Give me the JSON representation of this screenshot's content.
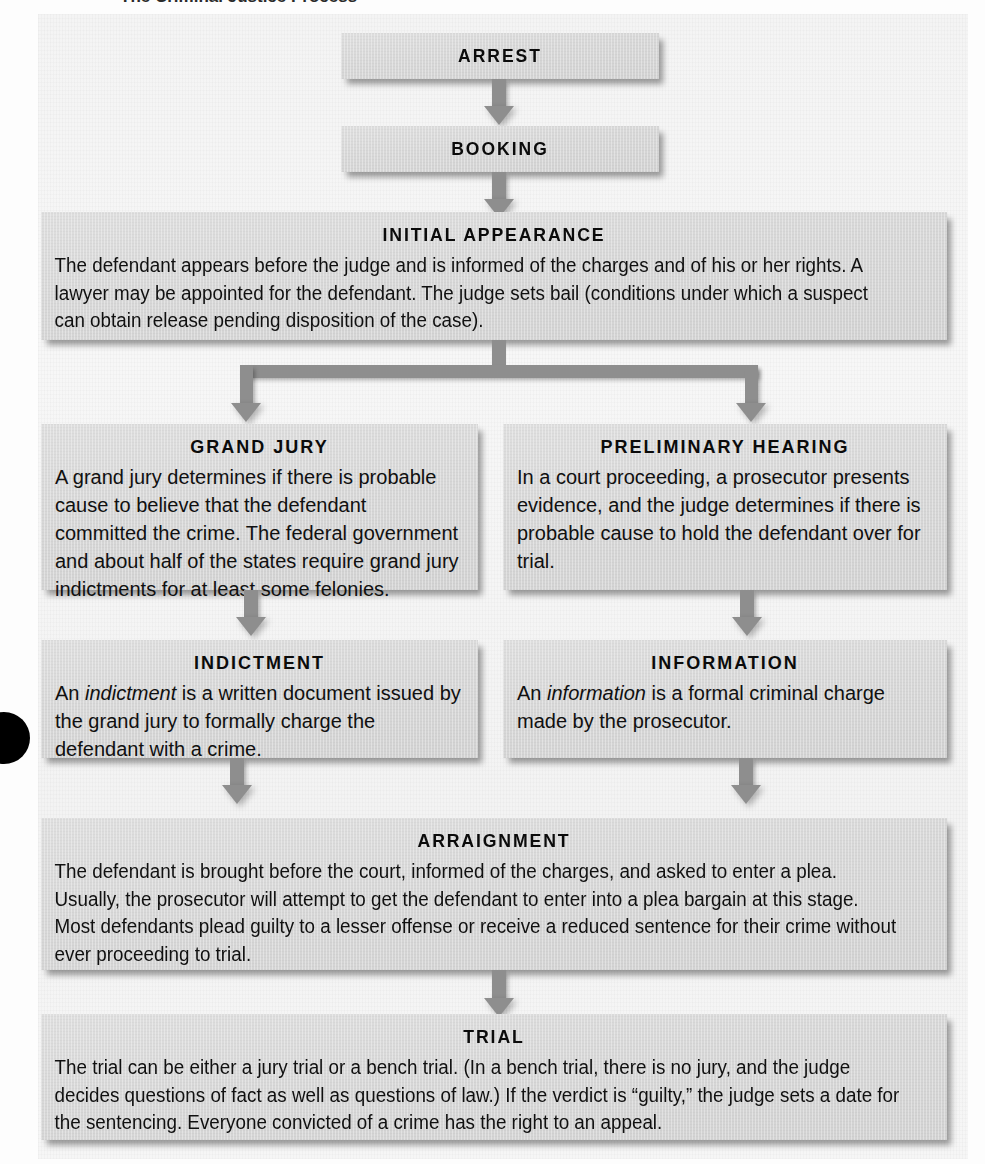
{
  "figure": {
    "kind": "flowchart",
    "clipped_header_sliver": "The Criminal Justice Process",
    "box_fill_color": "#d7d7d7",
    "connector_color": "#8e8e8e",
    "text_color": "#101010",
    "page_background": "#f5f5f5"
  },
  "nodes": {
    "arrest": {
      "title": "ARREST",
      "body": ""
    },
    "booking": {
      "title": "BOOKING",
      "body": ""
    },
    "initial_appearance": {
      "title": "INITIAL APPEARANCE",
      "body": "The defendant appears before the judge and is informed of the charges and of his or her rights. A lawyer may be appointed for the defendant. The judge sets bail (conditions under which a suspect can obtain release pending disposition of the case)."
    },
    "grand_jury": {
      "title": "GRAND JURY",
      "body": "A grand jury determines if there is probable cause to believe that the defendant committed the crime. The federal government and about half of the states require grand jury indictments for at least some felonies."
    },
    "preliminary_hearing": {
      "title": "PRELIMINARY HEARING",
      "body": "In a court proceeding, a prosecutor presents evidence, and the judge determines if there is probable cause to hold the defendant over for trial."
    },
    "indictment": {
      "title": "INDICTMENT",
      "body_part1": "An ",
      "body_italic": "indictment",
      "body_part2": " is a written document issued by the grand jury to formally charge the defendant with a crime."
    },
    "information": {
      "title": "INFORMATION",
      "body_part1": "An ",
      "body_italic": "information",
      "body_part2": " is a formal criminal charge made by the prosecutor."
    },
    "arraignment": {
      "title": "ARRAIGNMENT",
      "body": "The defendant is brought before the court, informed of the charges, and asked to enter a plea. Usually, the prosecutor will attempt to get the defendant to enter into a plea bargain at this stage. Most defendants plead guilty to a lesser offense or receive a reduced sentence for their crime without ever proceeding to trial."
    },
    "trial": {
      "title": "TRIAL",
      "body": "The trial can be either a jury trial or a bench trial. (In a bench trial, there is no jury, and the judge decides questions of fact as well as questions of law.) If the verdict is “guilty,” the judge sets a date for the sentencing. Everyone convicted of a crime has the right to an appeal."
    }
  },
  "edges": [
    {
      "from": "arrest",
      "to": "booking",
      "style": "straight-down-arrow"
    },
    {
      "from": "booking",
      "to": "initial_appearance",
      "style": "straight-down-arrow"
    },
    {
      "from": "initial_appearance",
      "to": "grand_jury",
      "style": "split-branch-left-arrow"
    },
    {
      "from": "initial_appearance",
      "to": "preliminary_hearing",
      "style": "split-branch-right-arrow"
    },
    {
      "from": "grand_jury",
      "to": "indictment",
      "style": "straight-down-arrow"
    },
    {
      "from": "preliminary_hearing",
      "to": "information",
      "style": "straight-down-arrow"
    },
    {
      "from": "indictment",
      "to": "arraignment",
      "style": "straight-down-arrow"
    },
    {
      "from": "information",
      "to": "arraignment",
      "style": "straight-down-arrow"
    },
    {
      "from": "arraignment",
      "to": "trial",
      "style": "straight-down-arrow"
    }
  ]
}
